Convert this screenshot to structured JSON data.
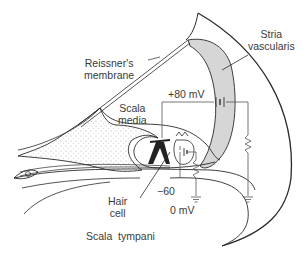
{
  "diagram": {
    "labels": {
      "reissners_membrane": [
        "Reissner's",
        "membrane"
      ],
      "stria_vascularis": [
        "Stria",
        "vascularis"
      ],
      "scala_media": [
        "Scala",
        "media"
      ],
      "hair_cell": [
        "Hair",
        "cell"
      ],
      "scala_tympani": "Scala  tympani",
      "voltage_top": "+80 mV",
      "voltage_cell": "−60",
      "voltage_ground": "0 mV"
    },
    "colors": {
      "line": "#2a2a2a",
      "stria_fill": "#d6d6d6",
      "stipple": "#9a9a9a",
      "text": "#3a3a3a"
    }
  }
}
